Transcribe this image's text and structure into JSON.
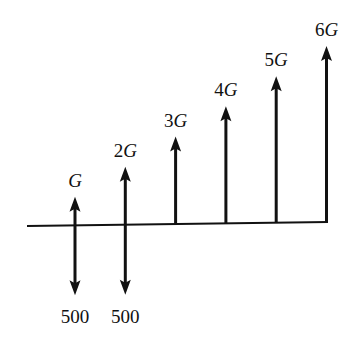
{
  "diagram": {
    "type": "cash-flow-diagram",
    "colors": {
      "ink": "#111111",
      "background": "#ffffff"
    },
    "baseline": {
      "periods": 6
    },
    "upward_flows": [
      {
        "period": 1,
        "coef": "",
        "symbol": "G",
        "multiple": 1
      },
      {
        "period": 2,
        "coef": "2",
        "symbol": "G",
        "multiple": 2
      },
      {
        "period": 3,
        "coef": "3",
        "symbol": "G",
        "multiple": 3
      },
      {
        "period": 4,
        "coef": "4",
        "symbol": "G",
        "multiple": 4
      },
      {
        "period": 5,
        "coef": "5",
        "symbol": "G",
        "multiple": 5
      },
      {
        "period": 6,
        "coef": "6",
        "symbol": "G",
        "multiple": 6
      }
    ],
    "downward_flows": [
      {
        "period": 1,
        "label": "500",
        "amount": 500
      },
      {
        "period": 2,
        "label": "500",
        "amount": 500
      }
    ]
  }
}
